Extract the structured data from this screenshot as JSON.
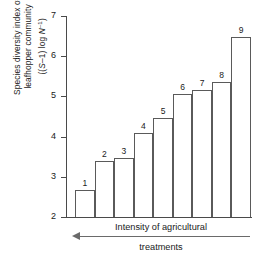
{
  "chart_data": {
    "type": "bar",
    "title": "",
    "xlabel": "Intensity of agricultural treatments",
    "ylabel": "Species diversity index of leafhopper community ((S-1) log N⁻¹)",
    "ylabel_line1": "Species diversity index of",
    "ylabel_line2_prefix": "leafhopper community",
    "ylabel_line3_open": "((",
    "ylabel_line3_S": "S",
    "ylabel_line3_mid": "–1) log ",
    "ylabel_line3_N": "N",
    "ylabel_line3_sup": "–1",
    "ylabel_line3_close": ")",
    "categories": [
      "1",
      "2",
      "3",
      "4",
      "5",
      "6",
      "7",
      "8",
      "9"
    ],
    "values": [
      2.68,
      3.39,
      3.46,
      4.08,
      4.47,
      5.06,
      5.15,
      5.37,
      6.48
    ],
    "ylim": [
      2,
      7
    ],
    "ytick_labels": [
      "7",
      "6",
      "5",
      "4",
      "3",
      "2"
    ],
    "ytick_values": [
      7,
      6,
      5,
      4,
      3,
      2
    ],
    "grid": false,
    "legend": null,
    "bar_fill": "#ffffff",
    "bar_stroke": "#5a5a5a",
    "axis_color": "#4a4a4a"
  },
  "xaxis_caption": {
    "line1": "Intensity of agricultural",
    "line2": "treatments",
    "arrow_direction": "left"
  }
}
